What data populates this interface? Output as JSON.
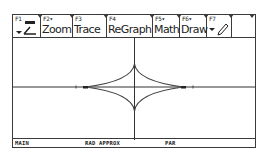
{
  "toolbar": {
    "items": [
      {
        "key": "F1",
        "label": "",
        "icon": "tools-icon",
        "has_dropdown": true
      },
      {
        "key": "F2▾",
        "label": "Zoom"
      },
      {
        "key": "F3",
        "label": "Trace"
      },
      {
        "key": "F4",
        "label": "ReGraph"
      },
      {
        "key": "F5▾",
        "label": "Math"
      },
      {
        "key": "F6▾",
        "label": "Draw"
      },
      {
        "key": "F7",
        "label": "",
        "icon": "pencil-icon",
        "has_dropdown": true
      },
      {
        "key": "",
        "label": ""
      }
    ]
  },
  "graph": {
    "curve": "astroid-like hypocycloid (4 cusps)",
    "axes": true,
    "colors": {
      "axis": "#333333",
      "curve": "#444444",
      "background": "#ffffff"
    }
  },
  "status": {
    "folder": "MAIN",
    "mode": "RAD APPROX",
    "graph_mode": "PAR"
  }
}
